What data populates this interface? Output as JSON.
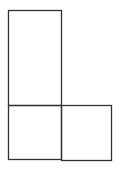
{
  "diagram": {
    "background": "#ffffff",
    "stroke_color": "#333333",
    "stroke_width": 1.3,
    "shapes": [
      {
        "id": "tall-rect",
        "x": 8,
        "y": 10,
        "width": 53,
        "height": 95
      },
      {
        "id": "bottom-left-square",
        "x": 8,
        "y": 105,
        "width": 53,
        "height": 54
      },
      {
        "id": "bottom-right-square",
        "x": 61,
        "y": 105,
        "width": 50,
        "height": 55
      }
    ]
  }
}
